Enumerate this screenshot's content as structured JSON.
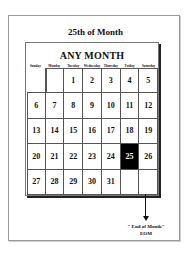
{
  "page": {
    "title": "25th of Month"
  },
  "calendar": {
    "month_title": "ANY MONTH",
    "weekdays": [
      "Sunday",
      "Monday",
      "Tuesday",
      "Wednesday",
      "Thursday",
      "Friday",
      "Saturday"
    ],
    "weeks": [
      [
        "",
        "",
        "1",
        "2",
        "3",
        "4",
        "5"
      ],
      [
        "6",
        "7",
        "8",
        "9",
        "10",
        "11",
        "12"
      ],
      [
        "13",
        "14",
        "15",
        "16",
        "17",
        "18",
        "19"
      ],
      [
        "20",
        "21",
        "22",
        "23",
        "24",
        "25",
        "26"
      ],
      [
        "27",
        "28",
        "29",
        "30",
        "31",
        "",
        ""
      ]
    ],
    "highlighted_day": "25",
    "highlight_color": "#000000"
  },
  "annotation": {
    "line1": "\" End of Month\"",
    "line2": "EOM"
  }
}
